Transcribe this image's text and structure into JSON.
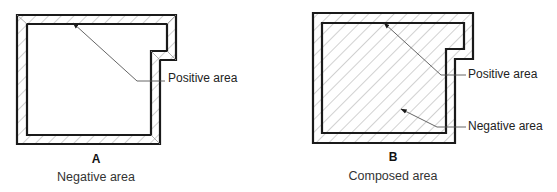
{
  "colors": {
    "outline": "#1a1a1a",
    "hatch": "#9a9a9a",
    "leader": "#555555",
    "background": "#ffffff"
  },
  "figures": [
    {
      "id": "A",
      "letter": "A",
      "caption": "Negative area",
      "hatched_region": "wall band only (between outer and inner outlines)",
      "callouts": [
        {
          "label": "Positive area"
        }
      ]
    },
    {
      "id": "B",
      "letter": "B",
      "caption": "Composed area",
      "hatched_region": "entire enclosed area (wall band plus interior)",
      "callouts": [
        {
          "label": "Positive area"
        },
        {
          "label": "Negative area"
        }
      ]
    }
  ]
}
